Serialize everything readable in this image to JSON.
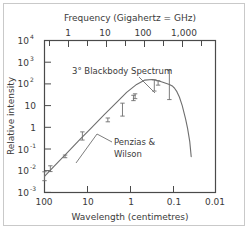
{
  "chart_data": {
    "type": "line",
    "title": "",
    "xlabel": "Wavelength (centimetres)",
    "xlabel_top": "Frequency (Gigahertz = GHz)",
    "ylabel": "Relative intensity",
    "xscale": "log",
    "yscale": "log",
    "x_axis_direction": "decreasing",
    "xlim": [
      100,
      0.01
    ],
    "ylim": [
      0.001,
      10000
    ],
    "grid": false,
    "legend": "none",
    "xticks_bottom": [
      "100",
      "10",
      "1",
      "0.1",
      "0.01"
    ],
    "xtick_values_bottom": [
      100,
      10,
      1,
      0.1,
      0.01
    ],
    "xticks_top": [
      "1",
      "10",
      "100",
      "1,000"
    ],
    "xtick_values_top": [
      1,
      10,
      100,
      1000
    ],
    "yticks": [
      {
        "base": "10",
        "exp": "4",
        "value": 10000
      },
      {
        "base": "10",
        "exp": "3",
        "value": 1000
      },
      {
        "base": "10",
        "exp": "2",
        "value": 100
      },
      {
        "base": "10",
        "exp": "",
        "value": 10
      },
      {
        "base": "1",
        "exp": "",
        "value": 1
      },
      {
        "base": "10",
        "exp": "-1",
        "value": 0.1
      },
      {
        "base": "10",
        "exp": "-2",
        "value": 0.01
      },
      {
        "base": "10",
        "exp": "-3",
        "value": 0.001
      }
    ],
    "series": [
      {
        "name": "3 degree blackbody curve",
        "kind": "curve",
        "x": [
          100,
          60,
          30,
          15,
          8,
          4,
          2,
          1.2,
          0.7,
          0.45,
          0.3,
          0.22,
          0.17,
          0.14,
          0.12,
          0.1,
          0.09,
          0.08,
          0.07,
          0.06,
          0.05,
          0.045,
          0.04,
          0.037
        ],
        "y": [
          0.0055,
          0.016,
          0.065,
          0.27,
          0.95,
          3.9,
          15,
          41,
          95,
          150,
          160,
          140,
          120,
          105,
          95,
          78,
          62,
          44,
          25,
          10,
          2.4,
          0.9,
          0.22,
          0.045
        ]
      },
      {
        "name": "Penzias & Wilson and other measurements",
        "kind": "points_with_errorbars",
        "points": [
          {
            "x": 100,
            "y": 0.0055,
            "yerr_low": 0.0035,
            "yerr_high": 0.009
          },
          {
            "x": 73,
            "y": 0.0125,
            "yerr_low": 0.0092,
            "yerr_high": 0.017
          },
          {
            "x": 33,
            "y": 0.046,
            "yerr_low": 0.04,
            "yerr_high": 0.053
          },
          {
            "x": 13,
            "y": 0.4,
            "yerr_low": 0.26,
            "yerr_high": 0.62
          },
          {
            "x": 3.3,
            "y": 2.2,
            "yerr_low": 1.8,
            "yerr_high": 2.7
          },
          {
            "x": 1.5,
            "y": 6.5,
            "yerr_low": 3.3,
            "yerr_high": 13
          },
          {
            "x": 0.83,
            "y": 22,
            "yerr_low": 17,
            "yerr_high": 30
          },
          {
            "x": 0.76,
            "y": 27,
            "yerr_low": 21,
            "yerr_high": 35
          },
          {
            "x": 0.27,
            "y": 85,
            "yerr_low": 47,
            "yerr_high": 155
          },
          {
            "x": 0.22,
            "y": 110,
            "yerr_low": 88,
            "yerr_high": 140
          },
          {
            "x": 0.12,
            "y": 95,
            "yerr_low": 19,
            "yerr_high": 430
          }
        ]
      }
    ],
    "annotations": [
      {
        "id": "blackbody-label",
        "text": "3° Blackbody Spectrum",
        "leader": true
      },
      {
        "id": "penzias-wilson-label",
        "line1": "Penzias &",
        "line2": "Wilson",
        "leader": true
      }
    ],
    "colors": {
      "curve": "#6e6e6e",
      "axis": "#4a4a4a",
      "text": "#3a3a3a",
      "frame": "#c9c9c9",
      "background": "#ffffff"
    }
  }
}
